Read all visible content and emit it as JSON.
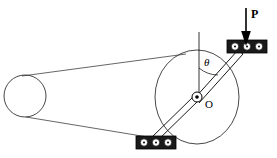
{
  "figure": {
    "background_color": "#ffffff",
    "line_color": "#000000",
    "belt_color": "#555555",
    "bearing_fill": "#1a1a1a",
    "roller_fill": "#ffffff",
    "width": 277,
    "height": 158
  },
  "labels": {
    "force": "P",
    "angle": "θ",
    "center": "O"
  },
  "components": {
    "small_pulley": {
      "name": "small-pulley",
      "cx": 25,
      "cy": 96,
      "r": 21
    },
    "large_pulley": {
      "name": "large-flywheel",
      "cx": 197,
      "cy": 97,
      "rx": 42,
      "ry": 47
    },
    "pivot": {
      "name": "pivot-hub",
      "cx": 197,
      "cy": 97,
      "r": 5,
      "dot_r": 1.8
    },
    "vertical_reference": {
      "name": "vertical-reference-line",
      "x": 199,
      "y1": 32,
      "y2": 98
    },
    "upper_bearing": {
      "name": "upper-bearing-block",
      "x": 227,
      "y": 40,
      "w": 40,
      "h": 13,
      "rollers": 3
    },
    "lower_bearing": {
      "name": "lower-bearing-block",
      "x": 136,
      "y": 136,
      "w": 40,
      "h": 13,
      "rollers": 3
    },
    "force_arrow": {
      "name": "force-arrow-P",
      "x": 246,
      "y1": 8,
      "y2": 44
    },
    "upper_rod": {
      "name": "upper-connecting-rod",
      "from": [
        197,
        97
      ],
      "to": [
        243,
        47
      ]
    },
    "lower_rod": {
      "name": "lower-connecting-rod",
      "from": [
        197,
        97
      ],
      "to": [
        154,
        140
      ]
    },
    "belt": {
      "name": "drive-belt",
      "upper": [
        [
          24,
          75
        ],
        [
          180,
          55
        ]
      ],
      "lower": [
        [
          27,
          117
        ],
        [
          168,
          139
        ]
      ]
    }
  }
}
